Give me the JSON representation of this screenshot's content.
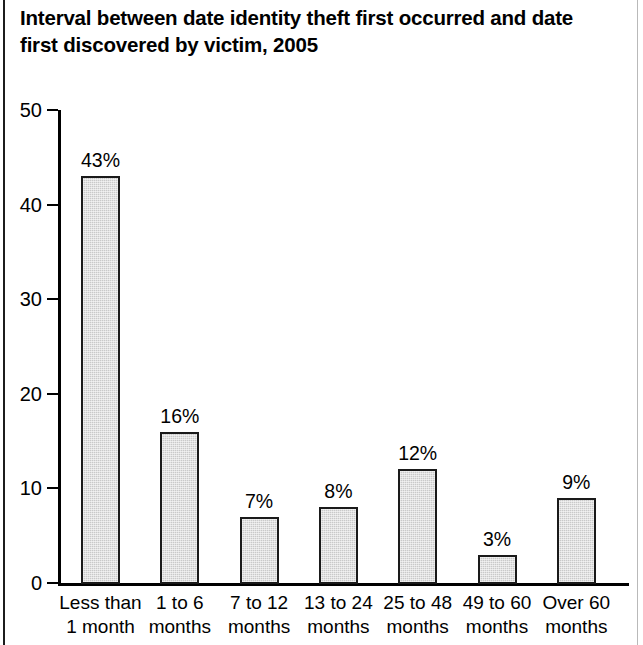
{
  "chart_data": {
    "type": "bar",
    "title": "Interval between date identity theft first occurred and date first discovered by victim, 2005",
    "title_line1": "Interval between date identity theft first occurred and date",
    "title_line2": "first discovered by victim, 2005",
    "xlabel": "",
    "ylabel": "",
    "ylim": [
      0,
      50
    ],
    "yticks": [
      0,
      10,
      20,
      30,
      40,
      50
    ],
    "ytick_labels": [
      "0",
      "10",
      "20",
      "30",
      "40",
      "50"
    ],
    "grid": false,
    "legend": "none",
    "categories": [
      "Less than 1 month",
      "1 to 6 months",
      "7 to 12 months",
      "13 to 24 months",
      "25 to 48 months",
      "49 to 60 months",
      "Over 60 months"
    ],
    "category_lines": [
      [
        "Less than",
        "1 month"
      ],
      [
        "1 to 6",
        "months"
      ],
      [
        "7 to 12",
        "months"
      ],
      [
        "13 to 24",
        "months"
      ],
      [
        "25 to 48",
        "months"
      ],
      [
        "49 to 60",
        "months"
      ],
      [
        "Over 60",
        "months"
      ]
    ],
    "values": [
      43,
      16,
      7,
      8,
      12,
      3,
      9
    ],
    "value_labels": [
      "43%",
      "16%",
      "7%",
      "8%",
      "12%",
      "3%",
      "9%"
    ],
    "colors": {
      "bar_fill": "#c9c9c9",
      "bar_border": "#1a1a1a",
      "axis": "#000000",
      "text": "#000000",
      "background": "#ffffff"
    }
  }
}
